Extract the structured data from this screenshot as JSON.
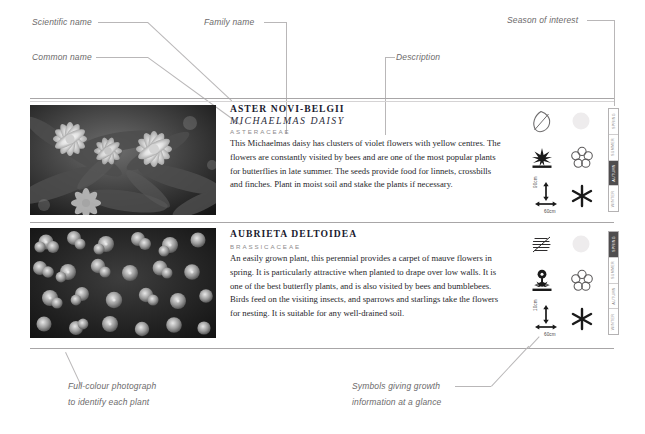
{
  "callouts": {
    "scientific_name": "Scientific name",
    "common_name": "Common name",
    "family_name": "Family name",
    "description": "Description",
    "season_of_interest": "Season of interest",
    "photo_note_line1": "Full-colour photograph",
    "photo_note_line2": "to identify each plant",
    "symbols_note_line1": "Symbols giving growth",
    "symbols_note_line2": "information at a glance"
  },
  "seasons": [
    "SPRING",
    "SUMMER",
    "AUTUMN",
    "WINTER"
  ],
  "entries": [
    {
      "scientific_name": "ASTER NOVI-BELGII",
      "common_name": "MICHAELMAS DAISY",
      "family_name": "ASTERACEAE",
      "description": "This Michaelmas daisy has clusters of violet flowers with yellow centres. The flowers are constantly visited by bees and are one of the most popular plants for butterflies in late summer. The seeds provide food for linnets, crossbills and finches. Plant in moist soil and stake the plants if necessary.",
      "photo_alt": "michaelmas-daisy-photograph",
      "symbols": {
        "leaf": "leaf-outline-icon",
        "sun": "sun-icon",
        "habit": "shrub-silhouette-icon",
        "flower": "flower-icon",
        "dimensions": "height-spread-icon",
        "star": "star-icon"
      },
      "height": "90cm",
      "spread": "60cm",
      "season_active": "AUTUMN"
    },
    {
      "scientific_name": "AUBRIETA DELTOIDEA",
      "common_name": "",
      "family_name": "BRASSICACEAE",
      "description": "An easily grown plant, this perennial provides a carpet of mauve flowers in spring. It is particularly attractive when planted to drape over low walls. It is one of the best butterfly plants, and is also visited by bees and bumblebees. Birds feed on the visiting insects, and sparrows and starlings take the flowers for nesting. It is suitable for any well-drained soil.",
      "photo_alt": "aubrieta-deltoidea-photograph",
      "symbols": {
        "leaf": "leaf-hatched-icon",
        "sun": "sun-icon",
        "habit": "flowering-plant-silhouette-icon",
        "flower": "flower-icon",
        "dimensions": "height-spread-icon",
        "star": "star-icon"
      },
      "height": "10cm",
      "spread": "60cm",
      "season_active": "SPRING"
    }
  ]
}
